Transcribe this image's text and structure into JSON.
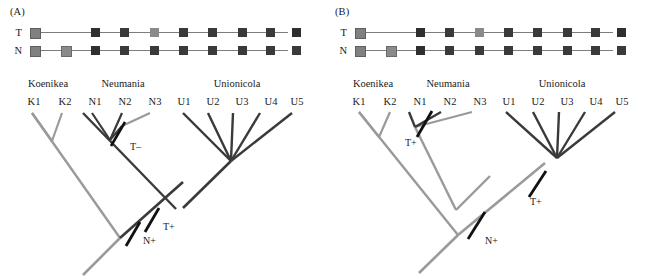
{
  "figure": {
    "panels": [
      {
        "id": "A",
        "label": "(A)",
        "matrix": {
          "row_labels": [
            "T",
            "N"
          ],
          "column_taxa": [
            "K1",
            "K2",
            "N1",
            "N2",
            "N3",
            "U1",
            "U2",
            "U3",
            "U4",
            "U5"
          ],
          "rows": [
            {
              "label": "T",
              "cells": [
                "mid",
                "none",
                "dark",
                "dark",
                "mid",
                "dark",
                "dark",
                "dark",
                "dark",
                "dark"
              ]
            },
            {
              "label": "N",
              "cells": [
                "mid",
                "mid",
                "dark",
                "dark",
                "dark",
                "dark",
                "dark",
                "dark",
                "dark",
                "dark"
              ]
            }
          ]
        },
        "genera": [
          {
            "name": "Koenikea",
            "taxa": [
              "K1",
              "K2"
            ]
          },
          {
            "name": "Neumania",
            "taxa": [
              "N1",
              "N2",
              "N3"
            ]
          },
          {
            "name": "Unionicola",
            "taxa": [
              "U1",
              "U2",
              "U3",
              "U4",
              "U5"
            ]
          }
        ],
        "tip_labels": [
          "K1",
          "K2",
          "N1",
          "N2",
          "N3",
          "U1",
          "U2",
          "U3",
          "U4",
          "U5"
        ],
        "event_marks": [
          {
            "id": "t-minus",
            "label": "T–"
          },
          {
            "id": "t-plus",
            "label": "T+"
          },
          {
            "id": "n-plus",
            "label": "N+"
          }
        ]
      },
      {
        "id": "B",
        "label": "(B)",
        "matrix": {
          "row_labels": [
            "T",
            "N"
          ],
          "column_taxa": [
            "K1",
            "K2",
            "N1",
            "N2",
            "N3",
            "U1",
            "U2",
            "U3",
            "U4",
            "U5"
          ],
          "rows": [
            {
              "label": "T",
              "cells": [
                "mid",
                "none",
                "dark",
                "dark",
                "mid",
                "dark",
                "dark",
                "dark",
                "dark",
                "dark"
              ]
            },
            {
              "label": "N",
              "cells": [
                "mid",
                "mid",
                "dark",
                "dark",
                "dark",
                "dark",
                "dark",
                "dark",
                "dark",
                "dark"
              ]
            }
          ]
        },
        "genera": [
          {
            "name": "Koenikea",
            "taxa": [
              "K1",
              "K2"
            ]
          },
          {
            "name": "Neumania",
            "taxa": [
              "N1",
              "N2",
              "N3"
            ]
          },
          {
            "name": "Unionicola",
            "taxa": [
              "U1",
              "U2",
              "U3",
              "U4",
              "U5"
            ]
          }
        ],
        "tip_labels": [
          "K1",
          "K2",
          "N1",
          "N2",
          "N3",
          "U1",
          "U2",
          "U3",
          "U4",
          "U5"
        ],
        "event_marks": [
          {
            "id": "t-plus-neumania",
            "label": "T+"
          },
          {
            "id": "t-plus-unionicola",
            "label": "T+"
          },
          {
            "id": "n-plus",
            "label": "N+"
          }
        ]
      }
    ],
    "colors": {
      "cell_dark": "#3a3a3a",
      "cell_mid": "#808080",
      "connector": "#7d7d7d",
      "branch_dark": "#3a3a3a",
      "branch_light": "#9a9a9a",
      "mark_stroke": "#111111",
      "text": "#1a1a1a",
      "background": "#ffffff"
    }
  }
}
